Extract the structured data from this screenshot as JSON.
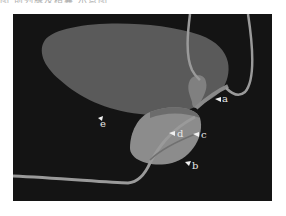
{
  "caption_fragment": "图 前列腺及精囊 示意图 ",
  "figure": {
    "background": "#141414",
    "labels": [
      {
        "id": "a",
        "text": "a",
        "x": 222,
        "y": 102
      },
      {
        "id": "b",
        "text": "b",
        "x": 192,
        "y": 166
      },
      {
        "id": "c",
        "text": "c",
        "x": 201,
        "y": 138
      },
      {
        "id": "d",
        "text": "d",
        "x": 177,
        "y": 137
      },
      {
        "id": "e",
        "text": "e",
        "x": 102,
        "y": 124
      }
    ],
    "colors": {
      "bladder": "#5a5a5a",
      "prostate": "#8c8c8c",
      "tube": "#9a9a9a",
      "arrow": "#f0f0f0"
    }
  }
}
